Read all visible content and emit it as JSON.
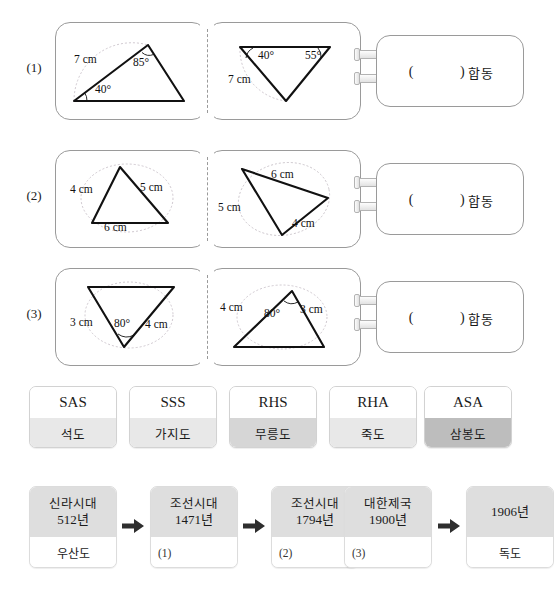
{
  "problems": [
    {
      "label": "(1)",
      "answer_prefix": "(",
      "answer_suffix": ")",
      "answer_word": "합동",
      "left_figure": {
        "name": "triangle-sas-asa-left",
        "labels": [
          {
            "text": "7 cm",
            "x": 18,
            "y": 30
          },
          {
            "text": "85°",
            "x": 77,
            "y": 33
          },
          {
            "text": "40°",
            "x": 39,
            "y": 60
          }
        ]
      },
      "right_figure": {
        "name": "triangle-sas-asa-right",
        "labels": [
          {
            "text": "40°",
            "x": 50,
            "y": 26
          },
          {
            "text": "55°",
            "x": 97,
            "y": 26
          },
          {
            "text": "7 cm",
            "x": 20,
            "y": 50
          }
        ]
      }
    },
    {
      "label": "(2)",
      "answer_prefix": "(",
      "answer_suffix": ")",
      "answer_word": "합동",
      "left_figure": {
        "name": "triangle-sss-left",
        "labels": [
          {
            "text": "4 cm",
            "x": 14,
            "y": 32
          },
          {
            "text": "5 cm",
            "x": 84,
            "y": 30
          },
          {
            "text": "6 cm",
            "x": 48,
            "y": 70
          }
        ]
      },
      "right_figure": {
        "name": "triangle-sss-right",
        "labels": [
          {
            "text": "6 cm",
            "x": 63,
            "y": 17
          },
          {
            "text": "5 cm",
            "x": 10,
            "y": 50
          },
          {
            "text": "4 cm",
            "x": 84,
            "y": 66
          }
        ]
      }
    },
    {
      "label": "(3)",
      "answer_prefix": "(",
      "answer_suffix": ")",
      "answer_word": "합동",
      "left_figure": {
        "name": "triangle-sas-left",
        "labels": [
          {
            "text": "3 cm",
            "x": 14,
            "y": 47
          },
          {
            "text": "80°",
            "x": 58,
            "y": 48
          },
          {
            "text": "4 cm",
            "x": 89,
            "y": 49
          }
        ]
      },
      "right_figure": {
        "name": "triangle-sas-right",
        "labels": [
          {
            "text": "4 cm",
            "x": 12,
            "y": 32
          },
          {
            "text": "80°",
            "x": 56,
            "y": 38
          },
          {
            "text": "3 cm",
            "x": 92,
            "y": 34
          }
        ]
      }
    }
  ],
  "term_cards": [
    {
      "code": "SAS",
      "name": "석도",
      "shade": "shade-light"
    },
    {
      "code": "SSS",
      "name": "가지도",
      "shade": "shade-light"
    },
    {
      "code": "RHS",
      "name": "무릉도",
      "shade": "shade-mid"
    },
    {
      "code": "RHA",
      "name": "죽도",
      "shade": "shade-light"
    },
    {
      "code": "ASA",
      "name": "삼봉도",
      "shade": "shade-dark"
    }
  ],
  "timeline": {
    "cards": [
      {
        "era": "신라시대",
        "year": "512년",
        "caption": "우산도",
        "caption_align": "center"
      },
      {
        "era": "조선시대",
        "year": "1471년",
        "caption": "(1)",
        "caption_align": "left"
      },
      {
        "era": "조선시대",
        "year": "1794년",
        "caption": "(2)",
        "caption_align": "left"
      },
      {
        "era": "대한제국",
        "year": "1900년",
        "caption": "(3)",
        "caption_align": "left"
      },
      {
        "era": "",
        "year": "1906년",
        "caption": "독도",
        "caption_align": "center"
      }
    ],
    "arrow_icon": "arrow-right-icon"
  },
  "colors": {
    "panel_border": "#9a9a9a",
    "card_border": "#d2d2d2",
    "shade_light": "#e8e8e8",
    "shade_mid": "#d6d6d6",
    "shade_dark": "#bdbdbd",
    "timeline_header": "#dedede",
    "stroke": "#111111",
    "arc": "#c9c2c9"
  }
}
